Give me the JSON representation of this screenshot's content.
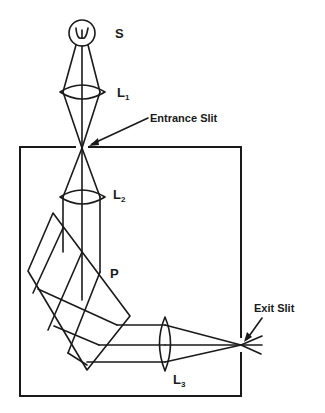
{
  "figure": {
    "type": "optical schematic - prism monochromator",
    "colors": {
      "line": "#1a1a1a",
      "background": "#ffffff"
    }
  },
  "labels": {
    "source": "S",
    "lens1": {
      "main": "L",
      "sub": "1"
    },
    "lens2": {
      "main": "L",
      "sub": "2"
    },
    "lens3": {
      "main": "L",
      "sub": "3"
    },
    "prism": "P",
    "entrance_slit": "Entrance Slit",
    "exit_slit": "Exit Slit"
  },
  "components": [
    {
      "id": "source",
      "label": "S",
      "shape": "circle-with-filament"
    },
    {
      "id": "lens-1",
      "label": "L1",
      "shape": "biconvex-lens"
    },
    {
      "id": "entrance-slit",
      "label": "Entrance Slit",
      "shape": "slit"
    },
    {
      "id": "lens-2",
      "label": "L2",
      "shape": "biconvex-lens"
    },
    {
      "id": "prism",
      "label": "P",
      "shape": "prism"
    },
    {
      "id": "lens-3",
      "label": "L3",
      "shape": "biconvex-lens"
    },
    {
      "id": "exit-slit",
      "label": "Exit Slit",
      "shape": "slit"
    },
    {
      "id": "housing",
      "label": "",
      "shape": "rectangle"
    }
  ]
}
